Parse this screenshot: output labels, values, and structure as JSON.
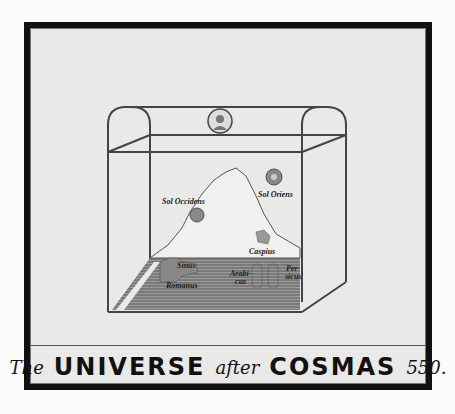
{
  "caption": {
    "the": "The",
    "universe": "UNIVERSE",
    "after": "after",
    "cosmas": "COSMAS",
    "year": "550."
  },
  "labels": {
    "sol_occidens": "Sol Occidens",
    "sol_oriens": "Sol Oriens",
    "caspius": "Caspius",
    "sinus": "Sinus",
    "romanus": "Romanus",
    "arabicus": "Arabi-\ncus",
    "persicus": "Per-\nsicus"
  },
  "icons": {
    "creator_medallion": "medallion-icon",
    "sun": "sun-icon"
  },
  "colors": {
    "frame": "#111111",
    "paper": "#e9e9e8",
    "ink": "#222222",
    "sea_hatch": "#777777"
  }
}
